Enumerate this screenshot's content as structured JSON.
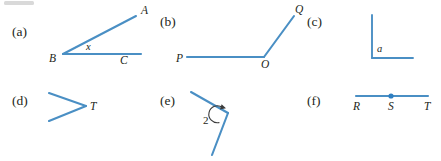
{
  "figure": {
    "width": 441,
    "height": 161,
    "background_color": "#ffffff",
    "line_color": "#4a8fc4",
    "label_color": "#231f20",
    "arc_color": "#3b3b3b",
    "vertex_dot_color": "#2f7fc1"
  },
  "panels": [
    {
      "tag": "(a)",
      "kind": "angle-two-rays",
      "vertex_label": "B",
      "endpoint_labels": [
        "A",
        "C"
      ],
      "interior_label": "x",
      "labels": {
        "A": "A",
        "B": "B",
        "C": "C",
        "x": "x"
      }
    },
    {
      "tag": "(b)",
      "kind": "angle-two-rays",
      "vertex_label": "O",
      "endpoint_labels": [
        "P",
        "Q"
      ],
      "interior_label": "",
      "labels": {
        "P": "P",
        "O": "O",
        "Q": "Q"
      }
    },
    {
      "tag": "(c)",
      "kind": "right-angle-unlabeled-endpoints",
      "vertex_label": "",
      "endpoint_labels": [],
      "interior_label": "a",
      "labels": {
        "a": "a"
      }
    },
    {
      "tag": "(d)",
      "kind": "angle-two-rays",
      "vertex_label": "T",
      "endpoint_labels": [],
      "interior_label": "",
      "labels": {
        "T": "T"
      }
    },
    {
      "tag": "(e)",
      "kind": "angle-numbered-arc",
      "vertex_label": "",
      "endpoint_labels": [],
      "interior_label": "2",
      "labels": {
        "2": "2"
      }
    },
    {
      "tag": "(f)",
      "kind": "straight-line-three-points",
      "vertex_label": "S",
      "endpoint_labels": [
        "R",
        "T"
      ],
      "interior_label": "",
      "labels": {
        "R": "R",
        "S": "S",
        "T": "T"
      }
    }
  ]
}
